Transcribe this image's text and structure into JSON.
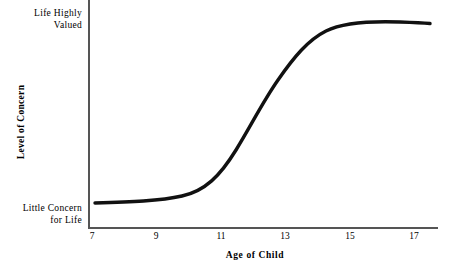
{
  "chart_data": {
    "type": "line",
    "title": "",
    "xlabel": "Age of Child",
    "ylabel": "Level of Concern",
    "xlim": [
      7,
      18
    ],
    "ylim": [
      0,
      100
    ],
    "grid": false,
    "legend": false,
    "x_tick_labels": [
      "7",
      "9",
      "11",
      "13",
      "15",
      "17"
    ],
    "x_ticks": [
      7,
      9,
      11,
      13,
      15,
      17
    ],
    "y_axis_endpoint_labels": {
      "high": "Life Highly\nValued",
      "high_line1": "Life Highly",
      "high_line2": "Valued",
      "low": "Little Concern\nfor Life",
      "low_line1": "Little Concern",
      "low_line2": "for Life"
    },
    "series": [
      {
        "name": "Level of Concern about Death",
        "color": "#000000",
        "x": [
          7.0,
          7.5,
          8.0,
          8.5,
          9.0,
          9.5,
          10.0,
          10.5,
          11.0,
          11.5,
          12.0,
          12.5,
          13.0,
          13.5,
          14.0,
          14.5,
          15.0,
          15.5,
          16.0,
          16.5,
          17.0,
          17.5
        ],
        "values": [
          4,
          4,
          5,
          5,
          6,
          7,
          9,
          14,
          23,
          36,
          50,
          63,
          75,
          84,
          90,
          94,
          96,
          97,
          98,
          98,
          98,
          98
        ]
      }
    ],
    "annotations": []
  },
  "curve": {
    "path": "M 95,203 C 130,202 160,201 182,196 C 205,191 220,176 236,150 C 252,124 262,103 278,80 C 294,57 308,40 326,31 C 344,22 372,21 400,22 C 414,22.5 424,23 430,23.5",
    "stroke_color": "#111111",
    "stroke_width": 3.4
  },
  "axes": {
    "line_color": "#555555"
  },
  "x_tick_positions_px": [
    92,
    156,
    221,
    285,
    350,
    414
  ]
}
